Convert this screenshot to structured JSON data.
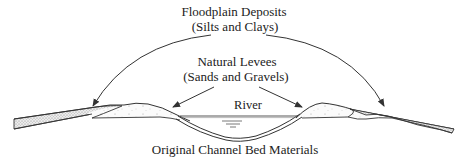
{
  "diagram": {
    "type": "cross-section",
    "labels": {
      "floodplain_title": "Floodplain Deposits",
      "floodplain_sub": "(Silts and Clays)",
      "levees_title": "Natural Levees",
      "levees_sub": "(Sands and Gravels)",
      "river": "River",
      "channel_bed": "Original Channel Bed Materials"
    },
    "arrows": [
      {
        "from": "floodplain-label",
        "to": "left-floodplain-deposit"
      },
      {
        "from": "floodplain-label",
        "to": "right-floodplain-deposit"
      },
      {
        "from": "levees-label",
        "to": "left-levee"
      },
      {
        "from": "levees-label",
        "to": "right-levee"
      }
    ],
    "colors": {
      "line": "#333333",
      "floodplain_fill": "#d9d9d9",
      "levee_fill": "#f4f4f4",
      "background": "#ffffff"
    }
  }
}
